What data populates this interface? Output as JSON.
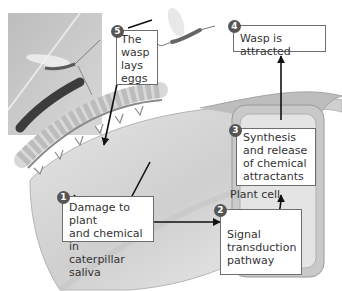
{
  "diagram": {
    "steps": [
      {
        "number": "1",
        "text_lines": [
          "Damage to plant",
          "and chemical in",
          "caterpillar saliva"
        ]
      },
      {
        "number": "2",
        "text_lines": [
          "Signal",
          "transduction",
          "pathway"
        ]
      },
      {
        "number": "3",
        "text_lines": [
          "Synthesis",
          "and release",
          "of chemical",
          "attractants"
        ]
      },
      {
        "number": "4",
        "text_lines": [
          "Wasp is attracted"
        ]
      },
      {
        "number": "5",
        "text_lines": [
          "The",
          "wasp",
          "lays",
          "eggs"
        ]
      }
    ],
    "plant_cell_label": "Plant cell",
    "photo": {
      "subject": "wasp-laying-eggs-on-caterpillar-photo"
    },
    "illustrations": [
      "leaf",
      "caterpillar",
      "flying-wasp",
      "plant-cell"
    ]
  }
}
